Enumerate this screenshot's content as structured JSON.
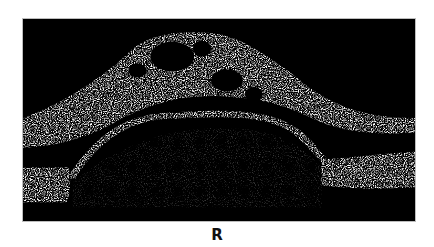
{
  "figure": {
    "panel_label": "R",
    "image_description": "OCT B-scan showing dome-shaped elevation with intraretinal cystic spaces",
    "colors": {
      "background": "#000000",
      "speckle": "#d8d8d8",
      "page": "#ffffff"
    }
  }
}
